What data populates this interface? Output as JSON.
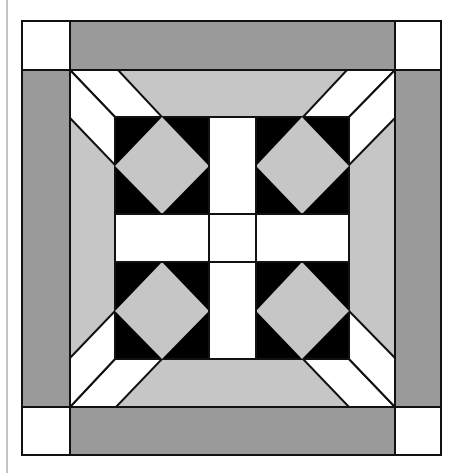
{
  "colors": {
    "background": "#ffffff",
    "outline": "#111111",
    "dark_gray": "#9a9a9a",
    "light_gray": "#c6c6c6",
    "white": "#ffffff",
    "black": "#000000",
    "left_rule": "#c4c4c4"
  },
  "block": {
    "outer": {
      "x1": 22,
      "y1": 21,
      "x2": 441,
      "y2": 455
    },
    "border_width": 48,
    "inner_frame": {
      "x1": 70,
      "y1": 70,
      "x2": 395,
      "y2": 407
    },
    "center_square": {
      "x1": 115,
      "y1": 117,
      "x2": 349,
      "y2": 359
    },
    "cross": {
      "vx1": 209,
      "vx2": 256,
      "hy1": 214,
      "hy2": 262
    }
  }
}
